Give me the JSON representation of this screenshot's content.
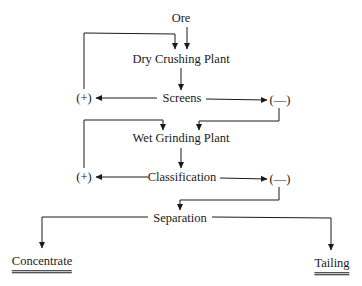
{
  "diagram": {
    "type": "flowchart",
    "nodes": {
      "ore": "Ore",
      "dry_crushing": "Dry Crushing Plant",
      "screens": "Screens",
      "screens_plus": "(+)",
      "screens_minus": "(—)",
      "wet_grinding": "Wet Grinding Plant",
      "classification": "Classification",
      "class_plus": "(+)",
      "class_minus": "(—)",
      "separation": "Separation",
      "concentrate": "Concentrate",
      "tailing": "Tailing"
    },
    "edges": [
      {
        "from": "Ore",
        "to": "Dry Crushing Plant"
      },
      {
        "from": "Dry Crushing Plant",
        "to": "Screens"
      },
      {
        "from": "Screens",
        "to": "(+)",
        "note": "oversize"
      },
      {
        "from": "(+)",
        "to": "Dry Crushing Plant",
        "note": "recycle"
      },
      {
        "from": "Screens",
        "to": "(—)",
        "note": "undersize"
      },
      {
        "from": "(—)",
        "to": "Wet Grinding Plant"
      },
      {
        "from": "Wet Grinding Plant",
        "to": "Classification"
      },
      {
        "from": "Classification",
        "to": "(+)",
        "note": "oversize"
      },
      {
        "from": "(+)",
        "to": "Wet Grinding Plant",
        "note": "recycle"
      },
      {
        "from": "Classification",
        "to": "(—)",
        "note": "undersize"
      },
      {
        "from": "(—)",
        "to": "Separation"
      },
      {
        "from": "Separation",
        "to": "Concentrate"
      },
      {
        "from": "Separation",
        "to": "Tailing"
      }
    ],
    "colors": {
      "line": "#1a1a1a",
      "background": "#ffffff"
    }
  }
}
